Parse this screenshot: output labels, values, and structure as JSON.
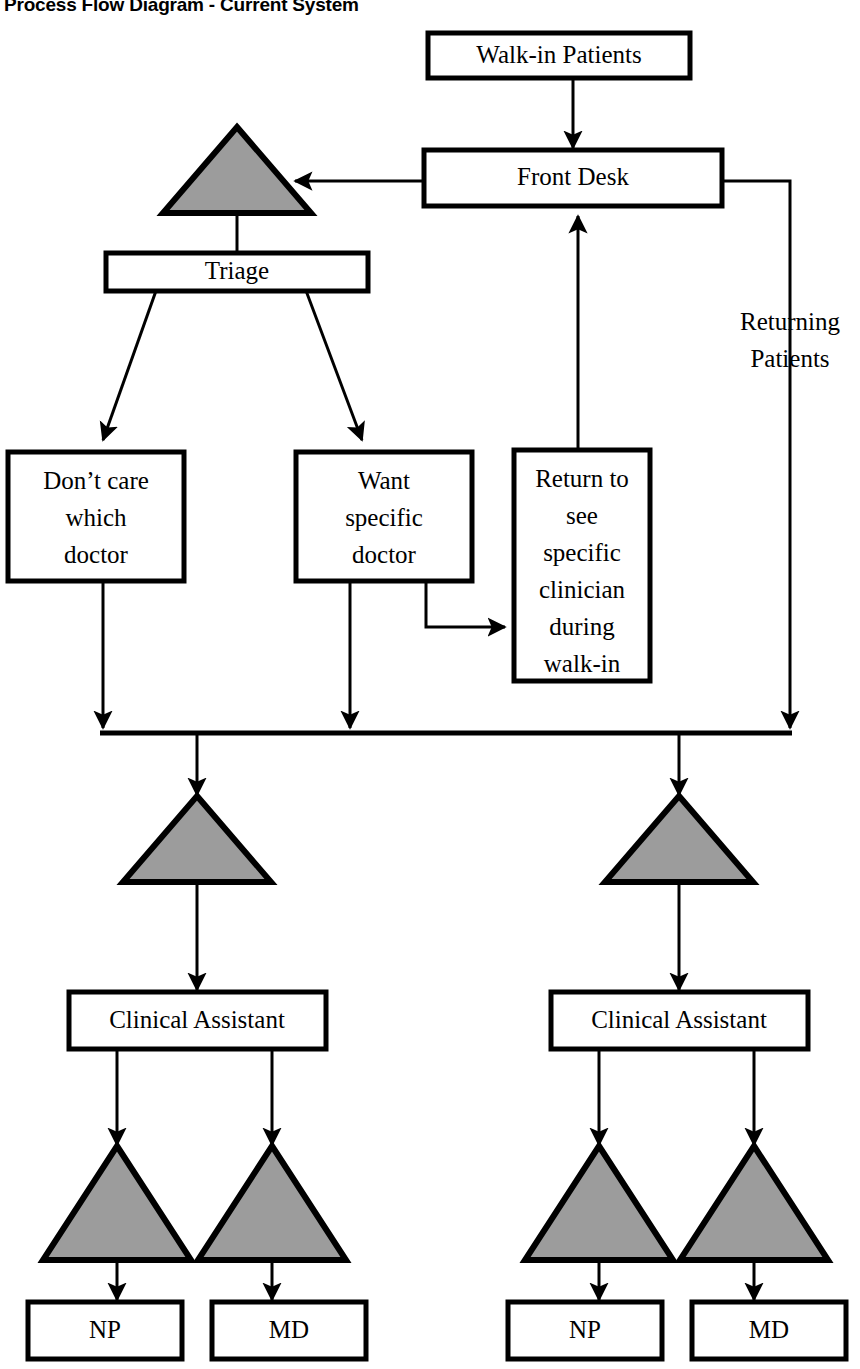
{
  "title": "Process Flow Diagram - Current System",
  "colors": {
    "queue_fill": "#9c9c9c",
    "stroke": "#000000",
    "box_fill": "#ffffff",
    "background": "#ffffff"
  },
  "nodes": {
    "walk_in_patients": {
      "label": "Walk-in Patients",
      "type": "process-box"
    },
    "front_desk": {
      "label": "Front Desk",
      "type": "process-box"
    },
    "triage": {
      "label": "Triage",
      "type": "process-box"
    },
    "dont_care": {
      "type": "process-box",
      "lines": [
        "Don’t care",
        "which",
        "doctor"
      ]
    },
    "want_specific": {
      "type": "process-box",
      "lines": [
        "Want",
        "specific",
        "doctor"
      ]
    },
    "return_specific": {
      "type": "process-box",
      "lines": [
        "Return to",
        "see",
        "specific",
        "clinician",
        "during",
        "walk-in"
      ]
    },
    "clinical_assistant_left": {
      "label": "Clinical Assistant",
      "type": "process-box"
    },
    "clinical_assistant_right": {
      "label": "Clinical Assistant",
      "type": "process-box"
    },
    "np_left": {
      "label": "NP",
      "type": "process-box"
    },
    "md_left": {
      "label": "MD",
      "type": "process-box"
    },
    "np_right": {
      "label": "NP",
      "type": "process-box"
    },
    "md_right": {
      "label": "MD",
      "type": "process-box"
    }
  },
  "queues": {
    "triage_queue": {
      "name": "queue-triage"
    },
    "left_queue": {
      "name": "queue-left"
    },
    "right_queue": {
      "name": "queue-right"
    },
    "np_left_queue": {
      "name": "queue-np-left"
    },
    "md_left_queue": {
      "name": "queue-md-left"
    },
    "np_right_queue": {
      "name": "queue-np-right"
    },
    "md_right_queue": {
      "name": "queue-md-right"
    }
  },
  "annotations": {
    "returning_patients": {
      "lines": [
        "Returning",
        "Patients"
      ]
    }
  },
  "flows": [
    {
      "from": "walk_in_patients",
      "to": "front_desk"
    },
    {
      "from": "front_desk",
      "to": "triage_queue"
    },
    {
      "from": "triage_queue",
      "to": "triage"
    },
    {
      "from": "triage",
      "to": "dont_care"
    },
    {
      "from": "triage",
      "to": "want_specific"
    },
    {
      "from": "want_specific",
      "to": "return_specific"
    },
    {
      "from": "return_specific",
      "to": "front_desk"
    },
    {
      "from": "front_desk",
      "to": "merge_bus",
      "label": "Returning Patients"
    },
    {
      "from": "dont_care",
      "to": "merge_bus"
    },
    {
      "from": "want_specific",
      "to": "merge_bus"
    },
    {
      "from": "merge_bus",
      "to": "left_queue"
    },
    {
      "from": "merge_bus",
      "to": "right_queue"
    },
    {
      "from": "left_queue",
      "to": "clinical_assistant_left"
    },
    {
      "from": "right_queue",
      "to": "clinical_assistant_right"
    },
    {
      "from": "clinical_assistant_left",
      "to": "np_left_queue"
    },
    {
      "from": "clinical_assistant_left",
      "to": "md_left_queue"
    },
    {
      "from": "clinical_assistant_right",
      "to": "np_right_queue"
    },
    {
      "from": "clinical_assistant_right",
      "to": "md_right_queue"
    },
    {
      "from": "np_left_queue",
      "to": "np_left"
    },
    {
      "from": "md_left_queue",
      "to": "md_left"
    },
    {
      "from": "np_right_queue",
      "to": "np_right"
    },
    {
      "from": "md_right_queue",
      "to": "md_right"
    }
  ]
}
